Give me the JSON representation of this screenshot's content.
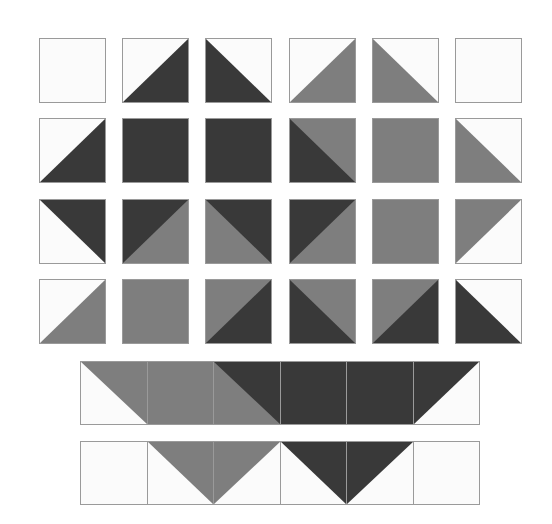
{
  "diagram": {
    "colors": {
      "W": "#fbfbfb",
      "G": "#7e7e7e",
      "D": "#393939",
      "border": "#9a9a9a"
    },
    "grid": {
      "origin_x": 39,
      "origin_y": 38,
      "tile_w": 67,
      "tile_h": 65,
      "step_x": 83.2,
      "step_y": 80.3,
      "rows": [
        [
          {
            "bg": "W",
            "tri": null,
            "tc": null
          },
          {
            "bg": "W",
            "tri": "lr",
            "tc": "D"
          },
          {
            "bg": "W",
            "tri": "ll",
            "tc": "D"
          },
          {
            "bg": "W",
            "tri": "lr",
            "tc": "G"
          },
          {
            "bg": "W",
            "tri": "ll",
            "tc": "G"
          },
          {
            "bg": "W",
            "tri": null,
            "tc": null
          }
        ],
        [
          {
            "bg": "W",
            "tri": "lr",
            "tc": "D"
          },
          {
            "bg": "D",
            "tri": null,
            "tc": null
          },
          {
            "bg": "D",
            "tri": null,
            "tc": null
          },
          {
            "bg": "G",
            "tri": "ll",
            "tc": "D"
          },
          {
            "bg": "G",
            "tri": null,
            "tc": null
          },
          {
            "bg": "W",
            "tri": "ll",
            "tc": "G"
          }
        ],
        [
          {
            "bg": "W",
            "tri": "ur",
            "tc": "D"
          },
          {
            "bg": "G",
            "tri": "ul",
            "tc": "D"
          },
          {
            "bg": "G",
            "tri": "ur",
            "tc": "D"
          },
          {
            "bg": "G",
            "tri": "ul",
            "tc": "D"
          },
          {
            "bg": "G",
            "tri": null,
            "tc": null
          },
          {
            "bg": "W",
            "tri": "ul",
            "tc": "G"
          }
        ],
        [
          {
            "bg": "W",
            "tri": "lr",
            "tc": "G"
          },
          {
            "bg": "G",
            "tri": null,
            "tc": null
          },
          {
            "bg": "G",
            "tri": "lr",
            "tc": "D"
          },
          {
            "bg": "G",
            "tri": "ll",
            "tc": "D"
          },
          {
            "bg": "G",
            "tri": "lr",
            "tc": "D"
          },
          {
            "bg": "W",
            "tri": "ll",
            "tc": "D"
          }
        ]
      ]
    },
    "strips": {
      "origin_x": 80,
      "cell_w": 66.5,
      "cell_h": 64,
      "items": [
        {
          "y": 361,
          "cells": [
            {
              "bg": "W",
              "tri": "ur",
              "tc": "G"
            },
            {
              "bg": "G",
              "tri": null,
              "tc": null
            },
            {
              "bg": "G",
              "tri": "ur",
              "tc": "D"
            },
            {
              "bg": "D",
              "tri": null,
              "tc": null
            },
            {
              "bg": "D",
              "tri": null,
              "tc": null
            },
            {
              "bg": "W",
              "tri": "ul",
              "tc": "D"
            }
          ]
        },
        {
          "y": 441,
          "cells": [
            {
              "bg": "W",
              "tri": null,
              "tc": null
            },
            {
              "bg": "W",
              "tri": "ur",
              "tc": "G"
            },
            {
              "bg": "W",
              "tri": "ul",
              "tc": "G"
            },
            {
              "bg": "W",
              "tri": "ur",
              "tc": "D"
            },
            {
              "bg": "W",
              "tri": "ul",
              "tc": "D"
            },
            {
              "bg": "W",
              "tri": null,
              "tc": null
            }
          ]
        }
      ]
    }
  }
}
